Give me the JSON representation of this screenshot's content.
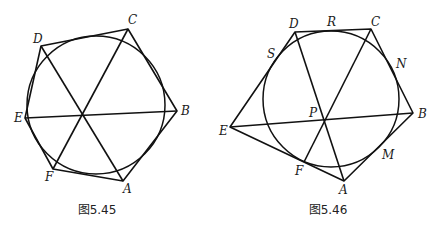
{
  "figures": [
    {
      "caption": "图5.45",
      "circle": {
        "cx": 96,
        "cy": 105,
        "r": 69
      },
      "vertices": {
        "A": {
          "x": 123,
          "y": 181,
          "label": "A",
          "lx": 123,
          "ly": 193
        },
        "B": {
          "x": 177,
          "y": 111,
          "label": "B",
          "lx": 181,
          "ly": 115
        },
        "C": {
          "x": 128,
          "y": 29,
          "label": "C",
          "lx": 128,
          "ly": 24
        },
        "D": {
          "x": 41,
          "y": 46,
          "label": "D",
          "lx": 33,
          "ly": 43
        },
        "E": {
          "x": 25,
          "y": 118,
          "label": "E",
          "lx": 14,
          "ly": 122
        },
        "F": {
          "x": 53,
          "y": 169,
          "label": "F",
          "lx": 45,
          "ly": 181
        }
      },
      "hexagon_order": [
        "A",
        "B",
        "C",
        "D",
        "E",
        "F"
      ],
      "diagonals": [
        [
          "A",
          "D"
        ],
        [
          "B",
          "E"
        ],
        [
          "C",
          "F"
        ]
      ]
    },
    {
      "caption": "图5.46",
      "circle": {
        "cx": 331,
        "cy": 99,
        "r": 68
      },
      "vertices": {
        "A": {
          "x": 344,
          "y": 181,
          "label": "A",
          "lx": 339,
          "ly": 194
        },
        "B": {
          "x": 413,
          "y": 113,
          "label": "B",
          "lx": 418,
          "ly": 118
        },
        "C": {
          "x": 371,
          "y": 29,
          "label": "C",
          "lx": 371,
          "ly": 26
        },
        "D": {
          "x": 295,
          "y": 32,
          "label": "D",
          "lx": 289,
          "ly": 28
        },
        "E": {
          "x": 230,
          "y": 127,
          "label": "E",
          "lx": 219,
          "ly": 135
        },
        "F": {
          "x": 304,
          "y": 162,
          "label": "F",
          "lx": 295,
          "ly": 175
        }
      },
      "points": {
        "P": {
          "label": "P",
          "lx": 309,
          "ly": 117
        },
        "R": {
          "label": "R",
          "lx": 327,
          "ly": 26
        },
        "S": {
          "label": "S",
          "lx": 267,
          "ly": 58
        },
        "N": {
          "label": "N",
          "lx": 396,
          "ly": 68
        },
        "M": {
          "label": "M",
          "lx": 382,
          "ly": 159
        }
      },
      "pentagon_order": [
        "A",
        "B",
        "C",
        "D",
        "E"
      ],
      "diagonals": [
        [
          "A",
          "D"
        ],
        [
          "B",
          "E"
        ],
        [
          "C",
          "F"
        ]
      ]
    }
  ]
}
